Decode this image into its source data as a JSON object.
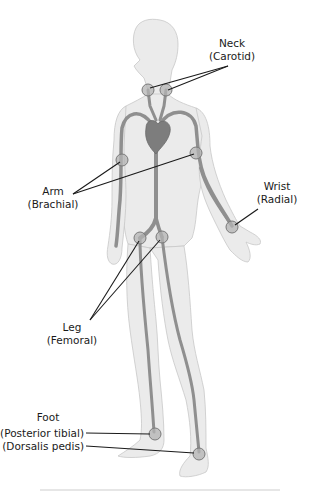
{
  "diagram": {
    "labels": {
      "neck": {
        "line1": "Neck",
        "line2": "(Carotid)"
      },
      "arm": {
        "line1": "Arm",
        "line2": "(Brachial)"
      },
      "wrist": {
        "line1": "Wrist",
        "line2": "(Radial)"
      },
      "leg": {
        "line1": "Leg",
        "line2": "(Femoral)"
      },
      "foot": {
        "line1": "Foot",
        "line2": "(Posterior tibial)",
        "line3": "(Dorsalis pedis)"
      }
    },
    "pulse_points": [
      {
        "name": "carotid-left",
        "x": 148,
        "y": 90
      },
      {
        "name": "carotid-right",
        "x": 166,
        "y": 90
      },
      {
        "name": "brachial-left",
        "x": 122,
        "y": 160
      },
      {
        "name": "brachial-right",
        "x": 196,
        "y": 153
      },
      {
        "name": "radial",
        "x": 232,
        "y": 227
      },
      {
        "name": "femoral-left",
        "x": 140,
        "y": 238
      },
      {
        "name": "femoral-right",
        "x": 162,
        "y": 237
      },
      {
        "name": "posterior-tibial",
        "x": 155,
        "y": 434
      },
      {
        "name": "dorsalis-pedis",
        "x": 199,
        "y": 454
      }
    ],
    "colors": {
      "body": "#ebebeb",
      "outline": "#c8c8c8",
      "artery": "#8f8f8f",
      "heart": "#7d7d7d",
      "text": "#1a1a1a"
    },
    "caption_visible": "partially cut off"
  }
}
